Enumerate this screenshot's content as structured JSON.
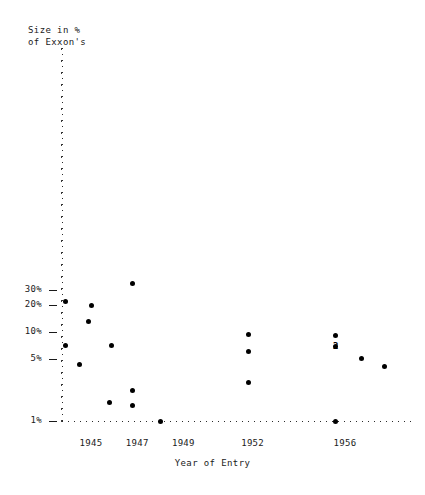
{
  "chart_data": {
    "type": "scatter",
    "title": "",
    "ylabel_line1": "Size in %",
    "ylabel_line2": "of Exxon's",
    "xlabel": "Year of Entry",
    "yscale": "log",
    "ylim": [
      1,
      40
    ],
    "ytick_labels": [
      "30%",
      "20%",
      "10%",
      "5%",
      "1%"
    ],
    "ytick_values": [
      30,
      20,
      10,
      5,
      1
    ],
    "xtick_labels": [
      "1945",
      "1947",
      "1949",
      "1952",
      "1956"
    ],
    "xtick_values": [
      1945,
      1947,
      1949,
      1952,
      1956
    ],
    "grid": false,
    "legend": "none",
    "points": [
      {
        "x": 1946.8,
        "y": 35.0,
        "count": 1
      },
      {
        "x": 1943.9,
        "y": 22.0,
        "count": 1
      },
      {
        "x": 1945.0,
        "y": 20.0,
        "count": 1
      },
      {
        "x": 1944.9,
        "y": 13.0,
        "count": 1
      },
      {
        "x": 1943.9,
        "y": 7.0,
        "count": 1
      },
      {
        "x": 1945.9,
        "y": 7.0,
        "count": 1
      },
      {
        "x": 1944.5,
        "y": 4.3,
        "count": 1
      },
      {
        "x": 1945.8,
        "y": 1.6,
        "count": 1
      },
      {
        "x": 1946.8,
        "y": 2.2,
        "count": 1
      },
      {
        "x": 1946.8,
        "y": 1.5,
        "count": 1
      },
      {
        "x": 1948.0,
        "y": 1.0,
        "count": 1
      },
      {
        "x": 1951.8,
        "y": 9.3,
        "count": 1
      },
      {
        "x": 1951.8,
        "y": 6.1,
        "count": 1
      },
      {
        "x": 1951.8,
        "y": 2.7,
        "count": 1
      },
      {
        "x": 1955.6,
        "y": 9.2,
        "count": 1
      },
      {
        "x": 1955.6,
        "y": 6.9,
        "count": 2
      },
      {
        "x": 1956.7,
        "y": 5.1,
        "count": 1
      },
      {
        "x": 1957.7,
        "y": 4.1,
        "count": 1
      },
      {
        "x": 1955.6,
        "y": 1.0,
        "count": 1
      }
    ],
    "annotations": [
      {
        "text": "2",
        "x": 1955.6,
        "y": 6.9,
        "note": "two overlapping observations"
      }
    ],
    "colors": {
      "marker": "#000000",
      "axis": "#2b2b2b",
      "text": "#1a1a1a",
      "background": "#ffffff"
    }
  }
}
